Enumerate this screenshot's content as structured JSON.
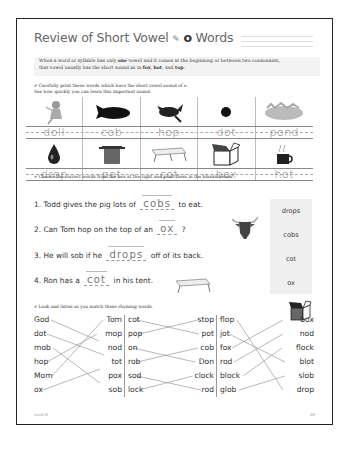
{
  "header": {
    "title_prefix": "Review of Short Vowel",
    "icon": "pencil-icon",
    "vowel": "o",
    "title_suffix": "Words"
  },
  "rule": {
    "line1_a": "When a word or syllable has only ",
    "line1_bold": "one",
    "line1_b": " vowel and it comes at the beginning or between two consonants,",
    "line2_a": "that vowel usually has the short sound as in ",
    "ex1": "fox",
    "ex2": "hot",
    "and": ", and ",
    "ex3": "top",
    "end": "."
  },
  "instructions": {
    "part1_line1": "✔ Carefully print these words which have the short vowel sound of o.",
    "part1_line2": "See how quickly you can learn this important sound.",
    "part2": "✔ Choose the correct words from the box at the right and print them in the blanks below.",
    "part3": "✔ Look and listen as you match these rhyming words."
  },
  "word_grid": {
    "row1": [
      {
        "picture": "doll-picture",
        "word": "doll"
      },
      {
        "picture": "corn-cob-picture",
        "word": "cob"
      },
      {
        "picture": "rabbit-hop-picture",
        "word": "hop"
      },
      {
        "picture": "dot-picture",
        "word": "dot"
      },
      {
        "picture": "pond-picture",
        "word": "pond"
      }
    ],
    "row2": [
      {
        "picture": "drop-picture",
        "word": "drop"
      },
      {
        "picture": "pot-picture",
        "word": "pot"
      },
      {
        "picture": "cot-picture",
        "word": "cot"
      },
      {
        "picture": "box-picture",
        "word": "box"
      },
      {
        "picture": "hot-cup-picture",
        "word": "hot"
      }
    ]
  },
  "sentences": [
    {
      "num": "1.",
      "before": "Todd gives the pig lots of",
      "answer": "cobs",
      "after": "to eat."
    },
    {
      "num": "2.",
      "before": "Can Tom hop on the top of an",
      "answer": "ox",
      "after": "?"
    },
    {
      "num": "3.",
      "before": "He will sob if he",
      "answer": "drops",
      "after": "off of its back."
    },
    {
      "num": "4.",
      "before": "Ron has a",
      "answer": "cot",
      "after": "in his tent."
    }
  ],
  "word_box": [
    "drops",
    "cobs",
    "cot",
    "ox"
  ],
  "matching": {
    "col1_left": [
      "God",
      "dot",
      "mob",
      "hop",
      "Mom",
      "ox"
    ],
    "col1_right": [
      "Tom",
      "mop",
      "nod",
      "tot",
      "pox",
      "sob"
    ],
    "col2_left": [
      "cot",
      "pop",
      "on",
      "rob",
      "sod",
      "lock"
    ],
    "col2_right": [
      "stop",
      "pot",
      "cob",
      "Don",
      "clock",
      "rod"
    ],
    "col3_left": [
      "flop",
      "jot",
      "fox",
      "rod",
      "block",
      "glob"
    ],
    "col3_right": [
      "box",
      "nod",
      "flock",
      "blot",
      "slob",
      "drop"
    ]
  },
  "footer": {
    "left": "Level B",
    "right": "89"
  }
}
